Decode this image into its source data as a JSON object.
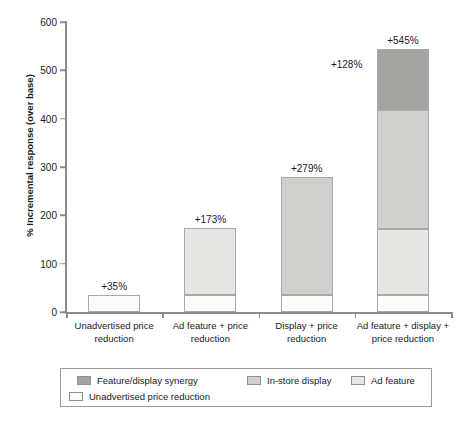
{
  "chart_data": {
    "type": "bar",
    "title": "",
    "subtitle": "",
    "xlabel": "",
    "ylabel": "% Incremental response (over base)",
    "ylim": [
      0,
      600
    ],
    "yticks": [
      0,
      100,
      200,
      300,
      400,
      500,
      600
    ],
    "ytick_labels": [
      "0",
      "100",
      "200",
      "300",
      "400",
      "500",
      "600"
    ],
    "grid": false,
    "stacked": true,
    "legend_position": "bottom",
    "categories": [
      "Unadvertised price reduction",
      "Ad feature + price reduction",
      "Display + price reduction",
      "Ad feature + display + price reduction"
    ],
    "series": [
      {
        "name": "Unadvertised price reduction",
        "color": "#fbfbf8",
        "values": [
          35,
          35,
          35,
          35
        ]
      },
      {
        "name": "Ad feature",
        "color": "#e6e6e2",
        "values": [
          0,
          138,
          0,
          137
        ]
      },
      {
        "name": "In-store display",
        "color": "#cfcfcb",
        "values": [
          0,
          0,
          244,
          245
        ]
      },
      {
        "name": "Feature/display synergy",
        "color": "#a3a3a0",
        "values": [
          0,
          0,
          0,
          128
        ]
      }
    ],
    "totals": [
      35,
      173,
      279,
      545
    ],
    "total_labels": [
      "+35%",
      "+173%",
      "+279%",
      "+545%"
    ],
    "annotations": [
      {
        "text": "+128%",
        "value": 128,
        "category": "Ad feature + display + price reduction",
        "refers_to": "Feature/display synergy"
      }
    ]
  },
  "legend": {
    "entries": [
      {
        "label": "Feature/display synergy",
        "color": "#a3a3a0"
      },
      {
        "label": "In-store display",
        "color": "#cfcfcb"
      },
      {
        "label": "Ad feature",
        "color": "#e6e6e2"
      },
      {
        "label": "Unadvertised price reduction",
        "color": "#fbfbf8"
      }
    ]
  },
  "axis": {
    "y_title": "% Incremental response (over base)",
    "axis_color": "#8c8c8c"
  }
}
